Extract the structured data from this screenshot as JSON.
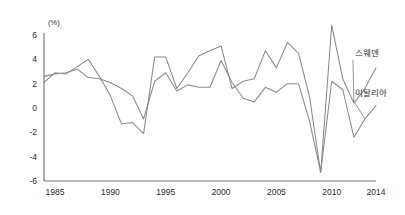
{
  "chart_data": {
    "type": "line",
    "title": "",
    "xlabel": "",
    "ylabel": "",
    "unit_label": "(%)",
    "grid": false,
    "legend_position": "inline-right",
    "xlim": [
      1984,
      2014
    ],
    "ylim": [
      -6,
      6
    ],
    "yticks": [
      6,
      4,
      2,
      0,
      -2,
      -4,
      -6
    ],
    "ytick_labels": [
      "6",
      "4",
      "2",
      "0",
      "-2",
      "-4",
      "-6"
    ],
    "xticks": [
      1985,
      1990,
      1995,
      2000,
      2005,
      2010,
      2014
    ],
    "xtick_labels": [
      "1985",
      "1990",
      "1995",
      "2000",
      "2005",
      "2010",
      "2014"
    ],
    "x": [
      1984,
      1985,
      1986,
      1987,
      1988,
      1989,
      1990,
      1991,
      1992,
      1993,
      1994,
      1995,
      1996,
      1997,
      1998,
      1999,
      2000,
      2001,
      2002,
      2003,
      2004,
      2005,
      2006,
      2007,
      2008,
      2009,
      2010,
      2011,
      2012,
      2013,
      2014
    ],
    "series": [
      {
        "name": "스웨덴",
        "name_en": "Sweden",
        "color": "#8a8a8a",
        "label_x": 2012.1,
        "label_y": 4.3,
        "values": [
          2.1,
          2.9,
          2.8,
          3.4,
          4.0,
          2.6,
          1.0,
          -1.3,
          -1.2,
          -2.1,
          4.2,
          4.2,
          1.6,
          2.9,
          4.3,
          4.7,
          5.1,
          1.6,
          2.2,
          2.4,
          4.7,
          3.3,
          5.4,
          4.5,
          0.9,
          -5.3,
          6.8,
          2.4,
          0.4,
          1.6,
          3.3
        ]
      },
      {
        "name": "이탈리아",
        "name_en": "Italy",
        "color": "#8a8a8a",
        "label_x": 2012.1,
        "label_y": 1.0,
        "values": [
          2.6,
          2.8,
          2.9,
          3.2,
          2.5,
          2.4,
          2.1,
          1.6,
          1.0,
          -0.9,
          2.2,
          2.9,
          1.4,
          1.9,
          1.7,
          1.7,
          3.9,
          2.1,
          0.8,
          0.5,
          1.7,
          1.3,
          2.0,
          2.0,
          -1.1,
          -5.3,
          2.2,
          1.5,
          -2.4,
          -0.9,
          0.2
        ]
      }
    ]
  }
}
